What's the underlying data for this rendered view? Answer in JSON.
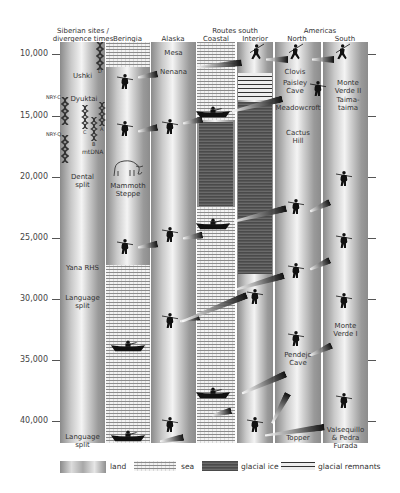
{
  "headers": {
    "siberia": "Siberian sites /\ndivergence times",
    "siberia_line1": "Siberian sites /",
    "siberia_line2": "divergence times",
    "beringia": "Beringia",
    "alaska": "Alaska",
    "routes_south": "Routes south",
    "coastal": "Coastal",
    "interior": "Interior",
    "americas": "Americas",
    "north": "North",
    "south": "South"
  },
  "y_axis": {
    "ticks": [
      "10,000",
      "15,000",
      "20,000",
      "25,000",
      "30,000",
      "35,000",
      "40,000"
    ],
    "unit": "years ago"
  },
  "siberia_labels": {
    "ushki": "Ushki",
    "dyuktai": "Dyuktai",
    "dental_split_1": "Dental",
    "dental_split_2": "split",
    "yana": "Yana RHS",
    "language_split_a1": "Language",
    "language_split_a2": "split",
    "language_split_b1": "Language",
    "language_split_b2": "split"
  },
  "genetics": {
    "nry_c": "NRY-C",
    "nry_q": "NRY-Q",
    "mtdna": "mtDNA",
    "haplo_d": "D",
    "haplo_c": "C",
    "haplo_b": "B",
    "haplo_a": "A"
  },
  "beringia_labels": {
    "mammoth_1": "Mammoth",
    "mammoth_2": "Steppe"
  },
  "alaska_labels": {
    "mesa": "Mesa",
    "nenana": "Nenana"
  },
  "north_labels": {
    "clovis": "Clovis",
    "paisley_1": "Paisley",
    "paisley_2": "Cave",
    "meadowcroft": "Meadowcroft",
    "cactus_1": "Cactus",
    "cactus_2": "Hill",
    "pendejo_1": "Pendejo",
    "pendejo_2": "Cave",
    "topper": "Topper"
  },
  "south_labels": {
    "mv2_1": "Monte",
    "mv2_2": "Verde II",
    "taima_1": "Taima-",
    "taima_2": "taima",
    "mv1_1": "Monte",
    "mv1_2": "Verde I",
    "valsequillo_1": "Valsequillo",
    "valsequillo_2": "& Pedra",
    "valsequillo_3": "Furada"
  },
  "legend": {
    "land": "land",
    "sea": "sea",
    "glacial_ice": "glacial ice",
    "glacial_remnants": "glacial remnants"
  },
  "colors": {
    "land_dark": "#8a8a8a",
    "land_light": "#f4f4f4",
    "sea": "#f2f2f2",
    "ice": "#595959",
    "figure": "#111111"
  }
}
